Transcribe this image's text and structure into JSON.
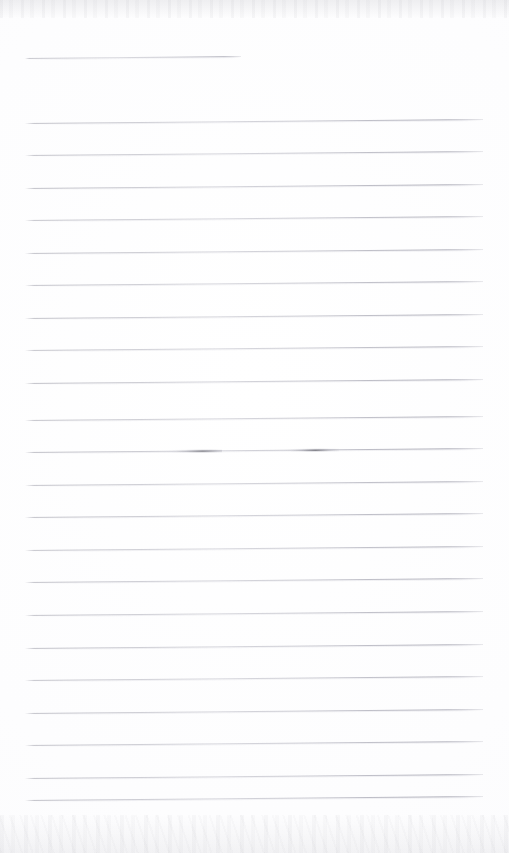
{
  "document": {
    "kind": "scanned-ruled-notebook-page",
    "title": "Blank Ruled Notebook Page",
    "page_width": 509,
    "page_height": 853,
    "paper_color": "#fefeff",
    "rule_color": "#b4b4c0",
    "rule_count": 24,
    "transcribed_text": "",
    "content_note": ""
  },
  "ruling": {
    "left_x": 25,
    "right_x": 483,
    "first_line_y": 58,
    "line_spacing": 32.5,
    "skew_degrees": -0.5,
    "lines": [
      {
        "index": 1,
        "y": 58,
        "x1": 25,
        "x2": 241,
        "weight": 0.72
      },
      {
        "index": 2,
        "y": 123,
        "x1": 25,
        "x2": 483,
        "weight": 0.8
      },
      {
        "index": 3,
        "y": 155,
        "x1": 25,
        "x2": 483,
        "weight": 0.78
      },
      {
        "index": 4,
        "y": 188,
        "x1": 25,
        "x2": 483,
        "weight": 0.82
      },
      {
        "index": 5,
        "y": 220,
        "x1": 25,
        "x2": 483,
        "weight": 0.76
      },
      {
        "index": 6,
        "y": 253,
        "x1": 25,
        "x2": 483,
        "weight": 0.8
      },
      {
        "index": 7,
        "y": 285,
        "x1": 25,
        "x2": 483,
        "weight": 0.78
      },
      {
        "index": 8,
        "y": 318,
        "x1": 25,
        "x2": 483,
        "weight": 0.8
      },
      {
        "index": 9,
        "y": 350,
        "x1": 25,
        "x2": 483,
        "weight": 0.76
      },
      {
        "index": 10,
        "y": 383,
        "x1": 25,
        "x2": 483,
        "weight": 0.82
      },
      {
        "index": 11,
        "y": 420,
        "x1": 25,
        "x2": 483,
        "weight": 0.78
      },
      {
        "index": 12,
        "y": 452,
        "x1": 25,
        "x2": 483,
        "weight": 0.84
      },
      {
        "index": 13,
        "y": 485,
        "x1": 25,
        "x2": 483,
        "weight": 0.78
      },
      {
        "index": 14,
        "y": 517,
        "x1": 25,
        "x2": 483,
        "weight": 0.8
      },
      {
        "index": 15,
        "y": 550,
        "x1": 25,
        "x2": 483,
        "weight": 0.76
      },
      {
        "index": 16,
        "y": 582,
        "x1": 25,
        "x2": 483,
        "weight": 0.8
      },
      {
        "index": 17,
        "y": 615,
        "x1": 25,
        "x2": 483,
        "weight": 0.78
      },
      {
        "index": 18,
        "y": 648,
        "x1": 25,
        "x2": 483,
        "weight": 0.8
      },
      {
        "index": 19,
        "y": 680,
        "x1": 25,
        "x2": 483,
        "weight": 0.76
      },
      {
        "index": 20,
        "y": 713,
        "x1": 25,
        "x2": 483,
        "weight": 0.8
      },
      {
        "index": 21,
        "y": 745,
        "x1": 25,
        "x2": 483,
        "weight": 0.78
      },
      {
        "index": 22,
        "y": 778,
        "x1": 25,
        "x2": 483,
        "weight": 0.8
      },
      {
        "index": 23,
        "y": 800,
        "x1": 25,
        "x2": 483,
        "weight": 0.82
      }
    ]
  },
  "marks": {
    "label": "faint pencil smudges",
    "items": [
      {
        "id": "smudge-left",
        "x": 158,
        "y": 450,
        "width": 64,
        "angle": -0.5
      },
      {
        "id": "smudge-right",
        "x": 283,
        "y": 449,
        "width": 56,
        "angle": -0.5
      }
    ]
  },
  "scan_artifacts": {
    "top_band": {
      "y": 0,
      "height": 18,
      "label": "scanner noise band top"
    },
    "bottom_band": {
      "y": 815,
      "height": 38,
      "label": "scanner noise band bottom"
    }
  },
  "regions": {
    "left_margin_label": "left margin",
    "right_margin_label": "right margin",
    "writing_area_label": "writing area"
  }
}
